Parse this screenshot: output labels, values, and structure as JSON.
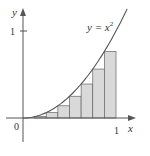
{
  "figure": {
    "curve_label": "y = x",
    "curve_exponent": "2",
    "x_axis_label": "x",
    "y_axis_label": "y",
    "origin_label": "0",
    "x_tick_label": "1",
    "y_tick_label": "1",
    "rect_fill": "#d9d9d9",
    "stroke": "#555555"
  },
  "chart_data": {
    "type": "area",
    "title": "",
    "function": "y = x^2",
    "xlabel": "x",
    "ylabel": "y",
    "xlim": [
      0,
      1
    ],
    "ylim": [
      0,
      1
    ],
    "rectangles": {
      "n": 8,
      "rule": "left endpoint",
      "x_left": [
        0,
        0.125,
        0.25,
        0.375,
        0.5,
        0.625,
        0.75,
        0.875
      ],
      "heights": [
        0,
        0.015625,
        0.0625,
        0.140625,
        0.25,
        0.390625,
        0.5625,
        0.765625
      ]
    }
  }
}
